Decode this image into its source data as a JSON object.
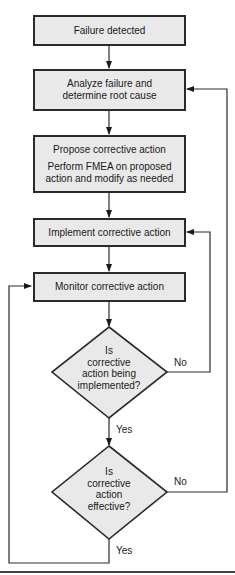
{
  "flowchart": {
    "nodes": [
      {
        "id": "failure-detected",
        "type": "process",
        "lines": [
          "Failure detected"
        ]
      },
      {
        "id": "analyze",
        "type": "process",
        "lines": [
          "Analyze failure and",
          "determine root cause"
        ]
      },
      {
        "id": "propose",
        "type": "process",
        "lines": [
          "Propose corrective action",
          "Perform FMEA on proposed",
          "action and modify as needed"
        ]
      },
      {
        "id": "implement",
        "type": "process",
        "lines": [
          "Implement corrective action"
        ]
      },
      {
        "id": "monitor",
        "type": "process",
        "lines": [
          "Monitor corrective action"
        ]
      },
      {
        "id": "decision-implemented",
        "type": "decision",
        "lines": [
          "Is",
          "corrective",
          "action being",
          "implemented?"
        ]
      },
      {
        "id": "decision-effective",
        "type": "decision",
        "lines": [
          "Is",
          "corrective",
          "action",
          "effective?"
        ]
      }
    ],
    "edge_labels": {
      "implemented_no": "No",
      "implemented_yes": "Yes",
      "effective_no": "No",
      "effective_yes": "Yes"
    },
    "edges": [
      {
        "from": "failure-detected",
        "to": "analyze"
      },
      {
        "from": "analyze",
        "to": "propose"
      },
      {
        "from": "propose",
        "to": "implement"
      },
      {
        "from": "implement",
        "to": "monitor"
      },
      {
        "from": "monitor",
        "to": "decision-implemented"
      },
      {
        "from": "decision-implemented",
        "to": "decision-effective",
        "label": "Yes"
      },
      {
        "from": "decision-implemented",
        "to": "implement",
        "label": "No"
      },
      {
        "from": "decision-effective",
        "to": "analyze",
        "label": "No"
      },
      {
        "from": "decision-effective",
        "to": "monitor",
        "label": "Yes"
      }
    ],
    "colors": {
      "box_fill": "#e9e9e9",
      "stroke": "#2a2a2a"
    }
  }
}
